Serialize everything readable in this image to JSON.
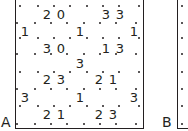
{
  "figure": {
    "panels": [
      {
        "id": "A",
        "label": "A"
      },
      {
        "id": "B",
        "label": "B"
      }
    ],
    "panel_a_clues": [
      {
        "value": "2",
        "x": 47,
        "y": 14
      },
      {
        "value": "0",
        "x": 61,
        "y": 14
      },
      {
        "value": "3",
        "x": 106,
        "y": 14
      },
      {
        "value": "3",
        "x": 120,
        "y": 14
      },
      {
        "value": "1",
        "x": 25,
        "y": 31
      },
      {
        "value": "1",
        "x": 80,
        "y": 31
      },
      {
        "value": "1",
        "x": 134,
        "y": 31
      },
      {
        "value": "3",
        "x": 47,
        "y": 48
      },
      {
        "value": "0",
        "x": 61,
        "y": 48
      },
      {
        "value": "1",
        "x": 106,
        "y": 48
      },
      {
        "value": "3",
        "x": 120,
        "y": 48
      },
      {
        "value": "3",
        "x": 80,
        "y": 63
      },
      {
        "value": "2",
        "x": 47,
        "y": 79
      },
      {
        "value": "3",
        "x": 61,
        "y": 79
      },
      {
        "value": "2",
        "x": 99,
        "y": 79
      },
      {
        "value": "1",
        "x": 113,
        "y": 79
      },
      {
        "value": "3",
        "x": 25,
        "y": 97
      },
      {
        "value": "1",
        "x": 80,
        "y": 97
      },
      {
        "value": "3",
        "x": 134,
        "y": 97
      },
      {
        "value": "2",
        "x": 47,
        "y": 114
      },
      {
        "value": "1",
        "x": 61,
        "y": 114
      },
      {
        "value": "2",
        "x": 99,
        "y": 114
      },
      {
        "value": "3",
        "x": 113,
        "y": 114
      }
    ]
  }
}
